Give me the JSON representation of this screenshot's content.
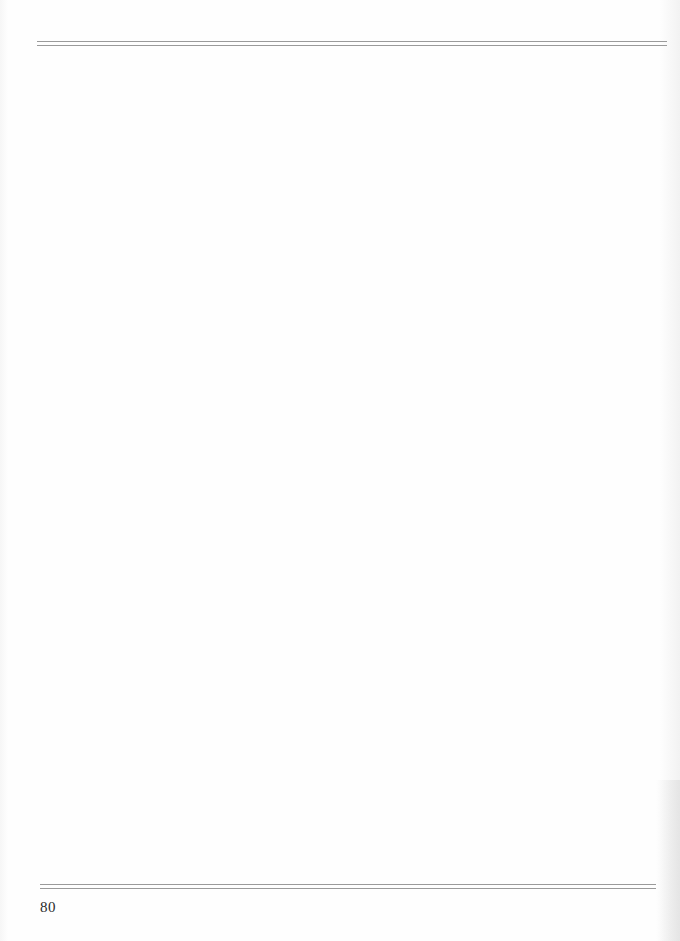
{
  "page": {
    "number": "80",
    "rules": {
      "top": "double-rule",
      "bottom": "double-rule",
      "color": "#9a9a9a"
    },
    "background": "#fdfdfd"
  }
}
